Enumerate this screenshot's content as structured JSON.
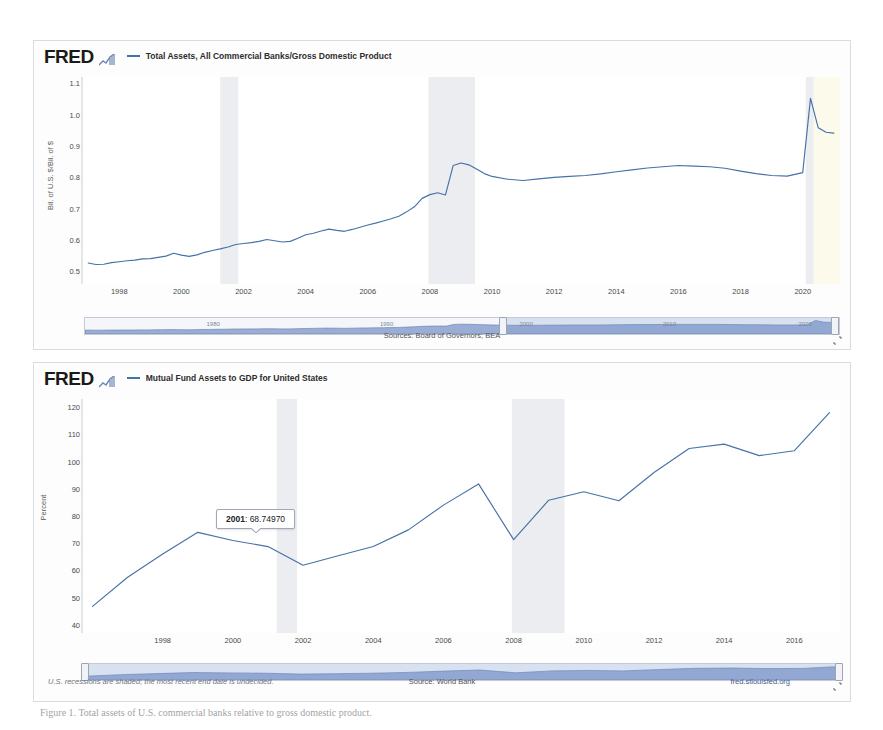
{
  "brand": {
    "logo_text": "FRED",
    "logo_mark": "chart-mark-icon"
  },
  "panel1": {
    "legend_label": "Total Assets, All Commercial Banks/Gross Domestic Product",
    "series_color": "#4572a7",
    "y_axis_title": "Bil. of U.S. $/Bil. of $",
    "y_ticks": [
      "1.1",
      "1.0",
      "0.9",
      "0.8",
      "0.7",
      "0.6",
      "0.5"
    ],
    "x_ticks": [
      "1998",
      "2000",
      "2002",
      "2004",
      "2006",
      "2008",
      "2010",
      "2012",
      "2014",
      "2016",
      "2018",
      "2020"
    ],
    "source_text": "Sources: Board of Governors; BEA",
    "slider_years": [
      "1980",
      "1990",
      "2000",
      "2010",
      "2020"
    ]
  },
  "panel2": {
    "legend_label": "Mutual Fund Assets to GDP for United States",
    "series_color": "#4572a7",
    "y_axis_title": "Percent",
    "y_ticks": [
      "120",
      "110",
      "100",
      "90",
      "80",
      "70",
      "60",
      "50",
      "40"
    ],
    "x_ticks": [
      "1998",
      "2000",
      "2002",
      "2004",
      "2006",
      "2008",
      "2010",
      "2012",
      "2014",
      "2016"
    ],
    "source_text": "Source: World Bank",
    "recession_note": "U.S. recessions are shaded; the most recent end date is undecided.",
    "site_url": "fred.stlouisfed.org",
    "tooltip": {
      "label": "2001",
      "separator": ": ",
      "value": "68.74970"
    }
  },
  "caption": {
    "text": "Figure 1. Total assets of U.S. commercial banks relative to gross domestic product."
  },
  "chart_data": [
    {
      "type": "line",
      "title": "Total Assets, All Commercial Banks/Gross Domestic Product",
      "xlabel": "",
      "ylabel": "Bil. of U.S. $/Bil. of $",
      "xlim": [
        1996.8,
        2021.2
      ],
      "ylim": [
        0.46,
        1.12
      ],
      "grid": false,
      "legend_position": "top",
      "series": [
        {
          "name": "Total Assets, All Commercial Banks/Gross Domestic Product",
          "color": "#4572a7",
          "x": [
            1997.0,
            1997.25,
            1997.5,
            1997.75,
            1998.0,
            1998.25,
            1998.5,
            1998.75,
            1999.0,
            1999.25,
            1999.5,
            1999.75,
            2000.0,
            2000.25,
            2000.5,
            2000.75,
            2001.0,
            2001.25,
            2001.5,
            2001.75,
            2002.0,
            2002.25,
            2002.5,
            2002.75,
            2003.0,
            2003.25,
            2003.5,
            2003.75,
            2004.0,
            2004.25,
            2004.5,
            2004.75,
            2005.0,
            2005.25,
            2005.5,
            2005.75,
            2006.0,
            2006.25,
            2006.5,
            2006.75,
            2007.0,
            2007.25,
            2007.5,
            2007.75,
            2008.0,
            2008.25,
            2008.5,
            2008.75,
            2009.0,
            2009.25,
            2009.5,
            2009.75,
            2010.0,
            2010.5,
            2011.0,
            2011.5,
            2012.0,
            2012.5,
            2013.0,
            2013.5,
            2014.0,
            2014.5,
            2015.0,
            2015.5,
            2016.0,
            2016.5,
            2017.0,
            2017.5,
            2018.0,
            2018.5,
            2019.0,
            2019.5,
            2020.0,
            2020.25,
            2020.5,
            2020.75,
            2021.0
          ],
          "y": [
            0.527,
            0.522,
            0.523,
            0.528,
            0.531,
            0.534,
            0.536,
            0.54,
            0.541,
            0.545,
            0.549,
            0.558,
            0.552,
            0.548,
            0.553,
            0.561,
            0.567,
            0.572,
            0.578,
            0.586,
            0.589,
            0.592,
            0.596,
            0.602,
            0.598,
            0.594,
            0.596,
            0.606,
            0.617,
            0.622,
            0.629,
            0.635,
            0.631,
            0.628,
            0.634,
            0.641,
            0.648,
            0.654,
            0.661,
            0.668,
            0.676,
            0.69,
            0.706,
            0.733,
            0.745,
            0.751,
            0.744,
            0.838,
            0.846,
            0.84,
            0.827,
            0.812,
            0.803,
            0.794,
            0.79,
            0.795,
            0.8,
            0.803,
            0.806,
            0.811,
            0.818,
            0.824,
            0.83,
            0.834,
            0.838,
            0.836,
            0.834,
            0.829,
            0.82,
            0.812,
            0.806,
            0.804,
            0.815,
            1.052,
            0.958,
            0.944,
            0.941
          ]
        }
      ],
      "recessions": [
        [
          2001.25,
          2001.83
        ],
        [
          2007.95,
          2009.45
        ],
        [
          2020.1,
          2020.35
        ]
      ],
      "recession_color": "#ebedf0",
      "undecided_band": [
        2020.1,
        2021.2
      ],
      "undecided_color": "#fcfaeb"
    },
    {
      "type": "line",
      "title": "Mutual Fund Assets to GDP for United States",
      "xlabel": "",
      "ylabel": "Percent",
      "xlim": [
        1995.7,
        2017.3
      ],
      "ylim": [
        37,
        123
      ],
      "grid": false,
      "legend_position": "top",
      "series": [
        {
          "name": "Mutual Fund Assets to GDP for United States",
          "color": "#4572a7",
          "x": [
            1996,
            1997,
            1998,
            1999,
            2000,
            2001,
            2002,
            2003,
            2004,
            2005,
            2006,
            2007,
            2008,
            2009,
            2010,
            2011,
            2012,
            2013,
            2014,
            2015,
            2016,
            2017
          ],
          "y": [
            46.8,
            57.5,
            66.0,
            74.0,
            71.0,
            68.75,
            61.9,
            65.4,
            68.8,
            74.9,
            84.0,
            91.8,
            71.3,
            85.8,
            88.9,
            85.6,
            96.0,
            104.8,
            106.4,
            102.2,
            104.0,
            118.0
          ]
        }
      ],
      "recessions": [
        [
          2001.25,
          2001.83
        ],
        [
          2007.95,
          2009.45
        ]
      ],
      "recession_color": "#ebedf0",
      "annotations": [
        {
          "x": 2001,
          "y": 68.7497,
          "label": "2001: 68.74970"
        }
      ]
    }
  ]
}
